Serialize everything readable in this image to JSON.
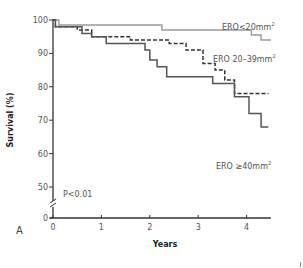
{
  "chart_data": {
    "type": "line",
    "subtype": "kaplan-meier-step",
    "panel_label": "A",
    "title": "",
    "xlabel": "Years",
    "ylabel": "Survival (%)",
    "xlim": [
      0,
      4.5
    ],
    "ylim": [
      0,
      100
    ],
    "y_axis_break": true,
    "x_ticks": [
      0,
      1,
      2,
      3,
      4
    ],
    "y_ticks": [
      0,
      50,
      60,
      70,
      80,
      90,
      100
    ],
    "grid": false,
    "legend": "inline labels",
    "annotation": "P<0.01",
    "series": [
      {
        "name": "ERO<20mm²",
        "label_main": "ERO<20mm",
        "label_sup": "2",
        "style": "solid-light",
        "color": "#9a9a9a",
        "x": [
          0,
          0.12,
          0.12,
          2.25,
          2.25,
          4.1,
          4.1,
          4.3,
          4.3,
          4.5
        ],
        "y": [
          100,
          100,
          98.5,
          98.5,
          97,
          97,
          95.5,
          95.5,
          94,
          94
        ]
      },
      {
        "name": "ERO 20–39mm²",
        "label_main": "ERO 20–39mm",
        "label_sup": "2",
        "style": "dashed-dark",
        "color": "#333333",
        "x": [
          0,
          0.05,
          0.05,
          0.5,
          0.5,
          0.8,
          0.8,
          1.6,
          1.6,
          2.4,
          2.4,
          2.75,
          2.75,
          3.1,
          3.1,
          3.35,
          3.35,
          3.55,
          3.55,
          3.75,
          3.75,
          4.45
        ],
        "y": [
          100,
          100,
          98,
          98,
          97,
          97,
          95,
          95,
          94,
          94,
          93,
          93,
          91,
          91,
          87,
          87,
          85,
          85,
          82,
          82,
          78,
          78
        ]
      },
      {
        "name": "ERO ≥40mm²",
        "label_main": "ERO ≥40mm",
        "label_sup": "2",
        "style": "solid-dark",
        "color": "#555555",
        "x": [
          0,
          0.05,
          0.05,
          0.6,
          0.6,
          0.8,
          0.8,
          1.1,
          1.1,
          1.9,
          1.9,
          2.0,
          2.0,
          2.15,
          2.15,
          2.35,
          2.35,
          3.3,
          3.3,
          3.75,
          3.75,
          4.05,
          4.05,
          4.3,
          4.3,
          4.45
        ],
        "y": [
          100,
          100,
          98,
          98,
          96,
          96,
          95,
          95,
          93,
          93,
          91,
          91,
          88,
          88,
          86,
          86,
          83,
          83,
          81,
          81,
          77,
          77,
          72,
          72,
          68,
          68
        ]
      }
    ]
  }
}
